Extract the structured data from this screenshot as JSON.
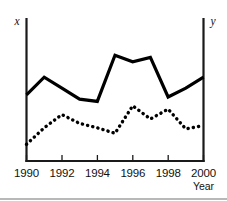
{
  "chart_data": {
    "type": "line",
    "title": "",
    "subtitle": "",
    "xlabel": "Year",
    "ylabel": "",
    "left_axis_label": "x",
    "right_axis_label": "y",
    "grid": false,
    "legend_position": "none",
    "xlim": [
      1990,
      2000
    ],
    "ylim": [
      0,
      100
    ],
    "x": [
      1990,
      1991,
      1992,
      1993,
      1994,
      1995,
      1996,
      1997,
      1998,
      1999,
      2000
    ],
    "xticks": [
      1990,
      1992,
      1994,
      1996,
      1998,
      2000
    ],
    "xticklabels": [
      "1990",
      "1992",
      "1994",
      "1996",
      "1998",
      "2000"
    ],
    "yticks": [],
    "yticklabels": [],
    "series": [
      {
        "name": "x",
        "style": "solid",
        "axis": "left",
        "values": [
          52,
          68,
          58,
          48,
          46,
          88,
          82,
          86,
          50,
          58,
          68
        ]
      },
      {
        "name": "y",
        "style": "dotted",
        "axis": "right",
        "values": [
          7,
          22,
          34,
          26,
          22,
          17,
          42,
          30,
          39,
          21,
          24
        ]
      }
    ]
  },
  "axes": {
    "left_label": "x",
    "right_label": "y",
    "x_caption": "Year",
    "tick_labels": [
      "1990",
      "1992",
      "1994",
      "1996",
      "1998",
      "2000"
    ]
  },
  "colors": {
    "ink": "#000000",
    "axis": "#1a1a1a",
    "background": "#ffffff",
    "footer_rule": "#b8b8b8"
  }
}
